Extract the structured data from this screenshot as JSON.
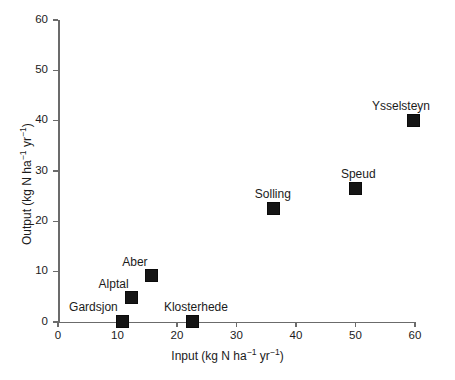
{
  "chart_data": {
    "type": "scatter",
    "title": "",
    "xlabel": "Input (kg N ha−1 yr−1)",
    "ylabel": "Output (kg N ha−1 yr−1)",
    "xlabel_parts": {
      "pre": "Input (kg N ha",
      "sup1": "−1",
      "mid": " yr",
      "sup2": "−1",
      "post": ")"
    },
    "ylabel_parts": {
      "pre": "Output (kg N ha",
      "sup1": "−1",
      "mid": " yr",
      "sup2": "−1",
      "post": ")"
    },
    "xlim": [
      0,
      60
    ],
    "ylim": [
      0,
      60
    ],
    "xticks": [
      0,
      10,
      20,
      30,
      40,
      50,
      60
    ],
    "yticks": [
      0,
      10,
      20,
      30,
      40,
      50,
      60
    ],
    "xtick_labels": [
      "0",
      "10",
      "20",
      "30",
      "40",
      "50",
      "60"
    ],
    "ytick_labels": [
      "0",
      "10",
      "20",
      "30",
      "40",
      "50",
      "60"
    ],
    "grid": false,
    "legend": false,
    "marker_style": "filled-square",
    "marker_color": "#151515",
    "axis_color": "#6b6b6b",
    "points": [
      {
        "label": "Gardsjon",
        "x": 10.6,
        "y": 0.3,
        "label_dx": -52,
        "label_dy": -20
      },
      {
        "label": "Alptal",
        "x": 12.2,
        "y": 5.0,
        "label_dx": -32,
        "label_dy": -20
      },
      {
        "label": "Aber",
        "x": 15.5,
        "y": 9.4,
        "label_dx": -28,
        "label_dy": -20
      },
      {
        "label": "Klosterhede",
        "x": 22.5,
        "y": 0.3,
        "label_dx": -28,
        "label_dy": -20
      },
      {
        "label": "Solling",
        "x": 36.1,
        "y": 22.8,
        "label_dx": -18,
        "label_dy": -20
      },
      {
        "label": "Speud",
        "x": 49.9,
        "y": 26.8,
        "label_dx": -14,
        "label_dy": -20
      },
      {
        "label": "Ysselsteyn",
        "x": 59.5,
        "y": 40.2,
        "label_dx": -40,
        "label_dy": -21
      }
    ]
  }
}
